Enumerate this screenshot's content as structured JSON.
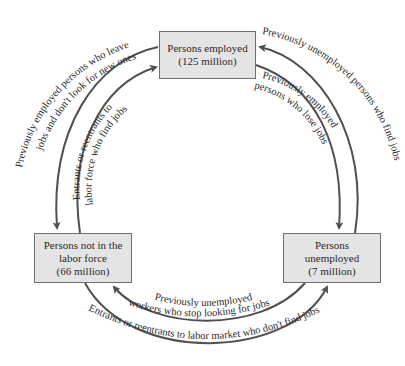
{
  "diagram": {
    "type": "labor-market-flow-cycle",
    "colors": {
      "box_fill": "#e4e4e4",
      "box_border": "#6f6f6f",
      "arrow": "#505050",
      "text": "#2a2a2a"
    },
    "nodes": {
      "employed": {
        "line1": "Persons employed",
        "line2": "(125 million)"
      },
      "not_in_labor_force": {
        "line1": "Persons not in the",
        "line2": "labor force",
        "line3": "(66 million)"
      },
      "unemployed": {
        "line1": "Persons",
        "line2": "unemployed",
        "line3": "(7 million)"
      }
    },
    "flows": {
      "employed_to_not_in_lf": {
        "line1": "Previously employed persons who leave",
        "line2": "jobs and don't look for new ones"
      },
      "not_in_lf_to_employed": {
        "line1": "Entrants or reentrants to",
        "line2": "labor force who find jobs"
      },
      "unemployed_to_employed": {
        "line1": "Previously unemployed persons who find jobs"
      },
      "employed_to_unemployed": {
        "line1": "Previously employed",
        "line2": "persons who lose jobs"
      },
      "unemployed_to_not_in_lf": {
        "line1": "Previously unemployed",
        "line2": "workers who stop looking for jobs"
      },
      "not_in_lf_to_unemployed": {
        "line1": "Entrants or reentrants to labor market who don't find jobs"
      }
    }
  }
}
